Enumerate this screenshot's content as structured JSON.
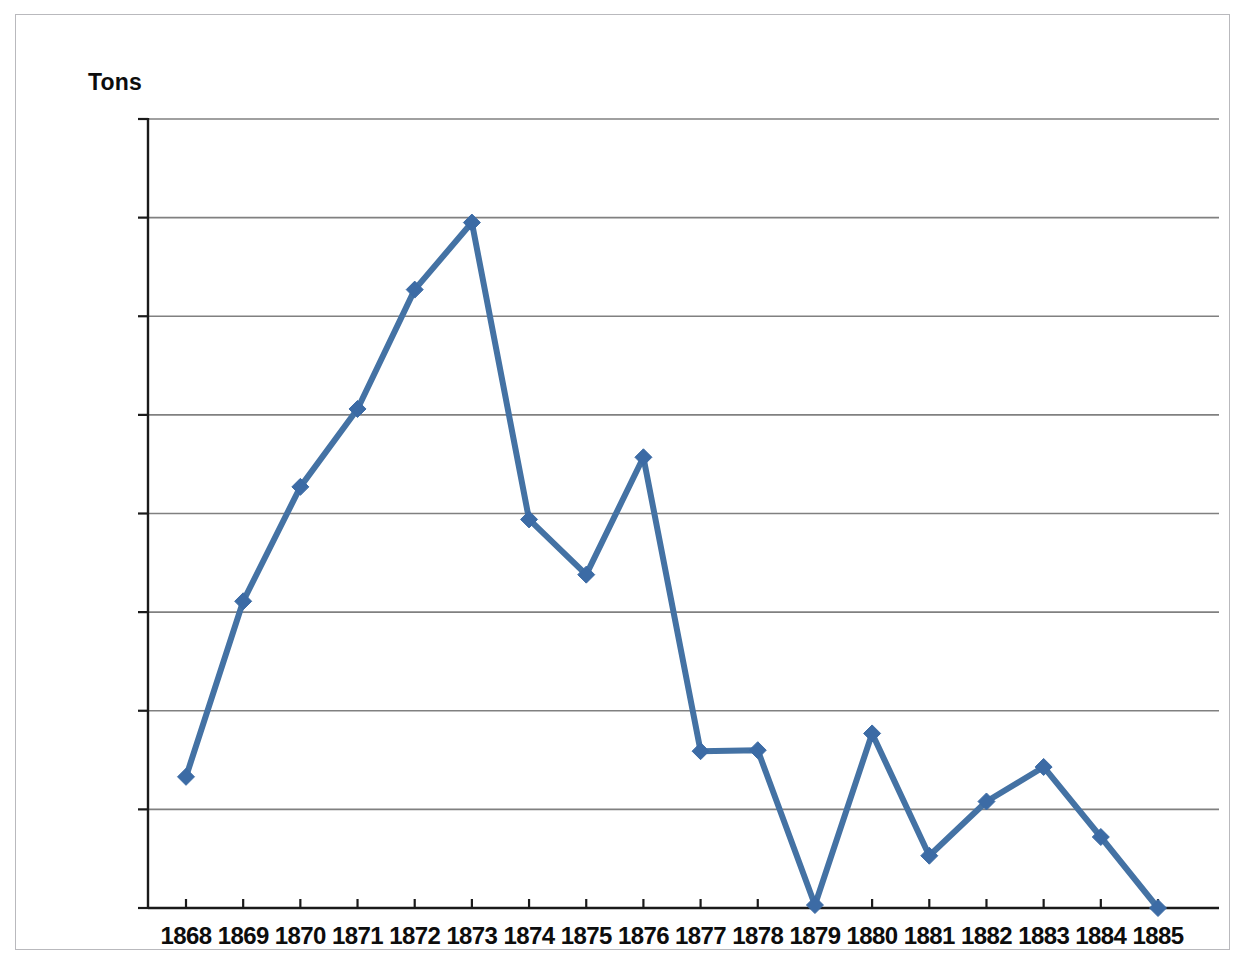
{
  "chart_data": {
    "type": "line",
    "title": "",
    "subtitle": "",
    "xlabel": "",
    "ylabel": "Tons",
    "ylabel_position": "above-axis-top",
    "categories": [
      "1868",
      "1869",
      "1870",
      "1871",
      "1872",
      "1873",
      "1874",
      "1875",
      "1876",
      "1877",
      "1878",
      "1879",
      "1880",
      "1881",
      "1882",
      "1883",
      "1884",
      "1885"
    ],
    "values": [
      13300,
      31100,
      42700,
      50600,
      62700,
      69500,
      39400,
      33800,
      45700,
      15900,
      16000,
      300,
      17700,
      5300,
      10800,
      14300,
      7200,
      0
    ],
    "series": [
      {
        "name": "Tons",
        "values": [
          13300,
          31100,
          42700,
          50600,
          62700,
          69500,
          39400,
          33800,
          45700,
          15900,
          16000,
          300,
          17700,
          5300,
          10800,
          14300,
          7200,
          0
        ]
      }
    ],
    "ylim": [
      0,
      80000
    ],
    "xlim_categories": [
      "1868",
      "1885"
    ],
    "y_ticks": [
      0,
      10000,
      20000,
      30000,
      40000,
      50000,
      60000,
      70000,
      80000
    ],
    "y_tick_labels": [
      "0",
      "10,000",
      "20,000",
      "30,000",
      "40,000",
      "50,000",
      "60,000",
      "70,000",
      "80,000"
    ],
    "grid": "horizontal",
    "legend": "none",
    "marker": "diamond",
    "line_color": "#4472a4",
    "marker_color": "#3c6ba5",
    "grid_color": "#808080",
    "axis_color": "#1a1a1a",
    "background": "#ffffff",
    "annotations": []
  },
  "frame": {
    "border_color": "#b9b9bd"
  }
}
